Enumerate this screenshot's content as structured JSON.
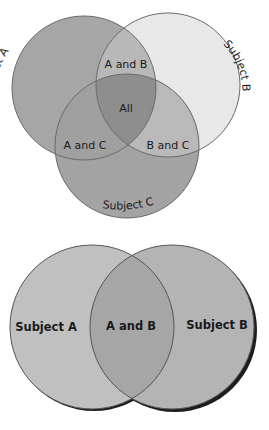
{
  "diagrams": [
    {
      "type": "venn-3",
      "sets": [
        {
          "id": "A",
          "label": "Subject A",
          "cx": 84,
          "cy": 88,
          "r": 72,
          "color": "#a6a6a6"
        },
        {
          "id": "B",
          "label": "Subject B",
          "cx": 168,
          "cy": 85,
          "r": 72,
          "color": "#e8e8e8"
        },
        {
          "id": "C",
          "label": "Subject C",
          "cx": 127,
          "cy": 146,
          "r": 72,
          "color": "#a3a3a3"
        }
      ],
      "regions": {
        "ab": {
          "label": "A and B",
          "color": "#b8b8b8"
        },
        "ac": {
          "label": "A and C",
          "color": "#a0a0a0"
        },
        "bc": {
          "label": "B and C",
          "color": "#b9b9b9"
        },
        "all": {
          "label": "All",
          "color": "#8e8e8e"
        }
      }
    },
    {
      "type": "venn-2",
      "sets": [
        {
          "id": "A",
          "label": "Subject A",
          "cx": 92,
          "cy": 327,
          "r": 82,
          "color": "#c0c0c0"
        },
        {
          "id": "B",
          "label": "Subject B",
          "cx": 172,
          "cy": 327,
          "r": 82,
          "color": "#b4b4b4"
        }
      ],
      "regions": {
        "ab": {
          "label": "A and B",
          "color": "#a6a6a6"
        }
      }
    }
  ]
}
